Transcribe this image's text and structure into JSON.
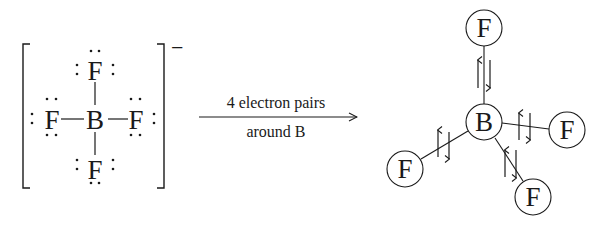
{
  "lewis_structure": {
    "central_atom": "B",
    "ligands": [
      {
        "position": "top",
        "symbol": "F"
      },
      {
        "position": "left",
        "symbol": "F"
      },
      {
        "position": "right",
        "symbol": "F"
      },
      {
        "position": "bottom",
        "symbol": "F"
      }
    ],
    "bond_symbol": "—",
    "lone_pair_symbol": ":",
    "charge": "−"
  },
  "arrow": {
    "label_top": "4 electron pairs",
    "label_bottom": "around B"
  },
  "geometry_diagram": {
    "central_atom": "B",
    "ligands": [
      {
        "position": "top",
        "symbol": "F"
      },
      {
        "position": "right",
        "symbol": "F"
      },
      {
        "position": "lower-left",
        "symbol": "F"
      },
      {
        "position": "bottom",
        "symbol": "F"
      }
    ],
    "electron_pair_symbol": "↑↓"
  },
  "colors": {
    "ink": "#1a1a1a",
    "background": "#ffffff"
  }
}
